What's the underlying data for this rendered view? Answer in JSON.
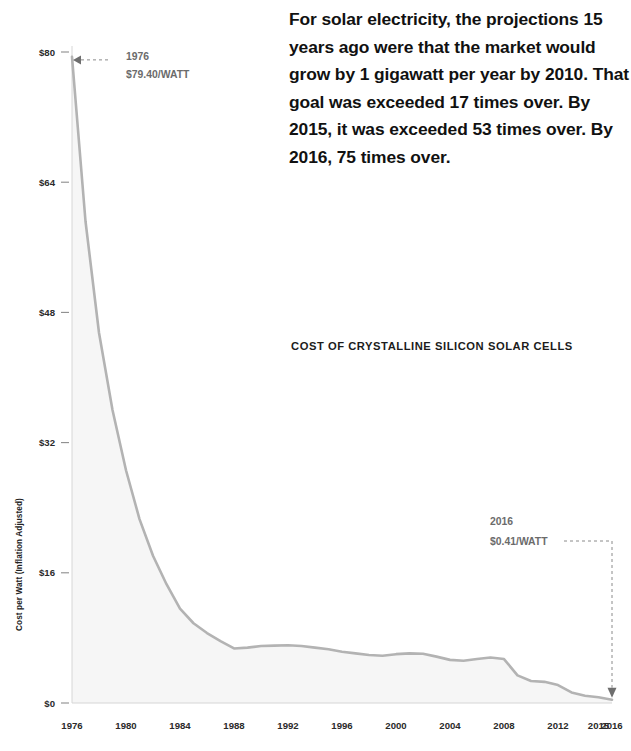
{
  "narrative": {
    "text": "For solar electricity, the projections 15 years ago were that the market would grow by 1 gigawatt per year by 2010. That goal was exceeded 17 times over. By 2015, it was exceeded 53 times over. By 2016, 75 times over."
  },
  "chart_caption": "COST OF CRYSTALLINE SILICON SOLAR CELLS",
  "annotations": {
    "start": {
      "year": "1976",
      "value": "$79.40/WATT"
    },
    "end": {
      "year": "2016",
      "value": "$0.41/WATT"
    }
  },
  "colors": {
    "line": "#b3b3b3",
    "area": "#f6f6f6",
    "text": "#111111",
    "callout": "#6b6b6b",
    "tick": "#8c8c8c"
  },
  "chart_data": {
    "type": "area",
    "title": "COST OF CRYSTALLINE SILICON SOLAR CELLS",
    "xlabel": "",
    "ylabel": "Cost per Watt (Inflation Adjusted)",
    "ylim": [
      0,
      80
    ],
    "yticks": [
      0,
      16,
      32,
      48,
      64,
      80
    ],
    "ytick_labels": [
      "$0",
      "$16",
      "$32",
      "$48",
      "$64",
      "$80"
    ],
    "xtick_labels": [
      "1976",
      "1980",
      "1984",
      "1988",
      "1992",
      "1996",
      "2000",
      "2004",
      "2008",
      "2012",
      "2015",
      "2016"
    ],
    "grid": false,
    "legend": null,
    "x": [
      1976,
      1977,
      1978,
      1979,
      1980,
      1981,
      1982,
      1983,
      1984,
      1985,
      1986,
      1987,
      1988,
      1989,
      1990,
      1991,
      1992,
      1993,
      1994,
      1995,
      1996,
      1997,
      1998,
      1999,
      2000,
      2001,
      2002,
      2003,
      2004,
      2005,
      2006,
      2007,
      2008,
      2009,
      2010,
      2011,
      2012,
      2013,
      2014,
      2015,
      2016
    ],
    "values": [
      79.4,
      59.2,
      45.5,
      36.0,
      28.6,
      22.6,
      18.1,
      14.6,
      11.6,
      9.8,
      8.6,
      7.6,
      6.7,
      6.8,
      7.0,
      7.05,
      7.1,
      7.0,
      6.8,
      6.6,
      6.3,
      6.1,
      5.9,
      5.8,
      6.0,
      6.1,
      6.05,
      5.7,
      5.3,
      5.2,
      5.4,
      5.6,
      5.4,
      3.4,
      2.7,
      2.6,
      2.2,
      1.3,
      0.9,
      0.7,
      0.41
    ],
    "series": [
      {
        "name": "Cost per watt (inflation adjusted)",
        "values": [
          79.4,
          59.2,
          45.5,
          36.0,
          28.6,
          22.6,
          18.1,
          14.6,
          11.6,
          9.8,
          8.6,
          7.6,
          6.7,
          6.8,
          7.0,
          7.05,
          7.1,
          7.0,
          6.8,
          6.6,
          6.3,
          6.1,
          5.9,
          5.8,
          6.0,
          6.1,
          6.05,
          5.7,
          5.3,
          5.2,
          5.4,
          5.6,
          5.4,
          3.4,
          2.7,
          2.6,
          2.2,
          1.3,
          0.9,
          0.7,
          0.41
        ]
      }
    ]
  }
}
